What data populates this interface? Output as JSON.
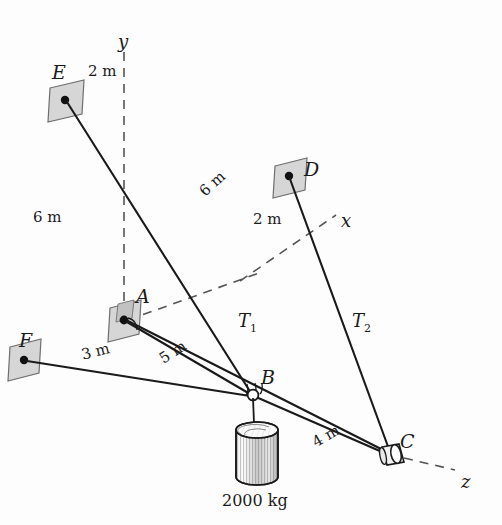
{
  "figure": {
    "background_color": "#fdfdfd",
    "line_color": "#1a1a1a",
    "bracket_fill": "#d6d6d6",
    "width": 502,
    "height": 525
  },
  "axes": [
    {
      "name": "y-axis",
      "label": "y",
      "x": 118,
      "y": 33,
      "style": "dashed"
    },
    {
      "name": "x-axis",
      "label": "x",
      "x": 341,
      "y": 212,
      "style": "dashed"
    },
    {
      "name": "z-axis",
      "label": "z",
      "x": 461,
      "y": 473,
      "style": "dashed"
    }
  ],
  "points": [
    {
      "id": "E",
      "label": "E",
      "label_x": 52,
      "label_y": 63,
      "anchor_x": 65,
      "anchor_y": 100,
      "type": "wall-bracket"
    },
    {
      "id": "D",
      "label": "D",
      "label_x": 304,
      "label_y": 160,
      "anchor_x": 289,
      "anchor_y": 176,
      "type": "wall-bracket"
    },
    {
      "id": "A",
      "label": "A",
      "label_x": 136,
      "label_y": 287,
      "anchor_x": 124,
      "anchor_y": 320,
      "type": "wall-bracket"
    },
    {
      "id": "F",
      "label": "F",
      "label_x": 19,
      "label_y": 331,
      "anchor_x": 24,
      "anchor_y": 360,
      "type": "wall-bracket"
    },
    {
      "id": "B",
      "label": "B",
      "label_x": 261,
      "label_y": 368,
      "anchor_x": 253,
      "anchor_y": 395,
      "type": "ring-knot"
    },
    {
      "id": "C",
      "label": "C",
      "label_x": 400,
      "label_y": 432,
      "anchor_x": 390,
      "anchor_y": 455,
      "type": "post-collar"
    }
  ],
  "members": [
    {
      "id": "EB",
      "from": "E",
      "to": "B",
      "label": "6 m",
      "label_x": 197,
      "label_y": 188,
      "label_rotation": -42
    },
    {
      "id": "FB",
      "from": "F",
      "to": "B",
      "label": "3 m",
      "label_x": 80,
      "label_y": 348,
      "label_rotation": -14
    },
    {
      "id": "AB",
      "from": "A",
      "to": "B",
      "label": "5 m",
      "label_x": 157,
      "label_y": 354,
      "label_rotation": -33
    },
    {
      "id": "BC",
      "from": "B",
      "to": "C",
      "label": "4 m",
      "label_x": 310,
      "label_y": 437,
      "label_rotation": -30
    },
    {
      "id": "AC",
      "from": "A",
      "to": "C",
      "label": "T",
      "label_sub": "1",
      "label_x": 238,
      "label_y": 312
    },
    {
      "id": "DC",
      "from": "D",
      "to": "C",
      "label": "T",
      "label_sub": "2",
      "label_x": 352,
      "label_y": 312
    }
  ],
  "dimensions": [
    {
      "id": "dim-E-to-y",
      "label": "2 m",
      "x": 88,
      "y": 64
    },
    {
      "id": "dim-left-height",
      "label": "6 m",
      "x": 33,
      "y": 210
    },
    {
      "id": "dim-D-to-x",
      "label": "2 m",
      "x": 253,
      "y": 212
    }
  ],
  "load": {
    "id": "suspended-mass",
    "label": "2000 kg",
    "label_x": 222,
    "label_y": 493,
    "cylinder": {
      "cx": 257,
      "top_y": 430,
      "bottom_y": 485,
      "rx": 21,
      "ry": 8
    },
    "hanger_from": "B"
  }
}
